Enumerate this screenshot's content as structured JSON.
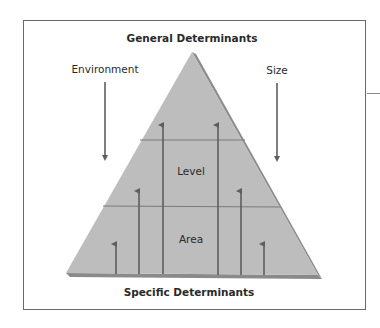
{
  "diagram": {
    "top_label": "General Determinants",
    "bottom_label": "Specific Determinants",
    "left_factor": "Environment",
    "right_factor": "Size",
    "tiers": [
      {
        "label": "Level"
      },
      {
        "label": "Area"
      }
    ],
    "colors": {
      "pyramid_face": "#bdbdbd",
      "pyramid_edge": "#8c8c8c",
      "arrow": "#5e5e5e",
      "frame": "#6a6a6a",
      "text": "#2a2a2a"
    },
    "upward_arrows": [
      {
        "position": "far-left",
        "height": "short"
      },
      {
        "position": "mid-left",
        "height": "medium"
      },
      {
        "position": "inner-left",
        "height": "tall"
      },
      {
        "position": "inner-right",
        "height": "tall"
      },
      {
        "position": "mid-right",
        "height": "medium"
      },
      {
        "position": "far-right",
        "height": "short"
      }
    ],
    "downward_arrows": [
      {
        "position": "left",
        "label_ref": "Environment"
      },
      {
        "position": "right",
        "label_ref": "Size"
      }
    ]
  }
}
